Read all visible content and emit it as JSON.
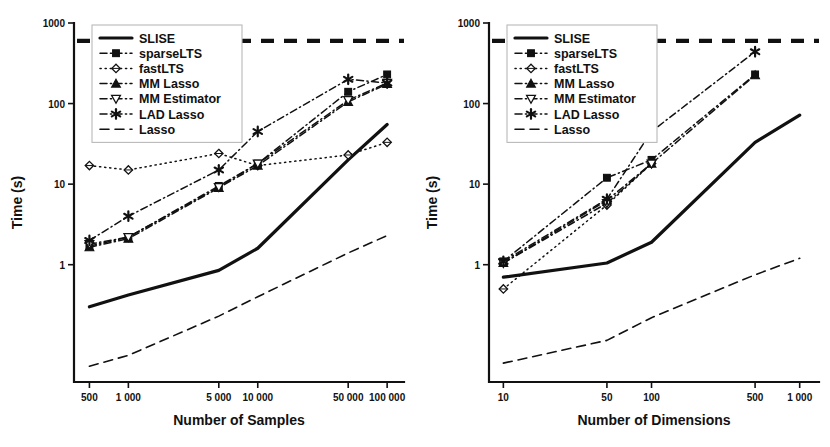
{
  "figure": {
    "background": "#ffffff",
    "ink": "#111111"
  },
  "legend": {
    "entries": [
      {
        "label": "SLISE",
        "key": "slise",
        "dash": "none",
        "width": 3.2,
        "marker": "none"
      },
      {
        "label": "sparseLTS",
        "key": "sparselts",
        "dash": "dashdot",
        "width": 1.5,
        "marker": "square"
      },
      {
        "label": "fastLTS",
        "key": "fastlts",
        "dash": "dotted",
        "width": 1.5,
        "marker": "diamond"
      },
      {
        "label": "MM Lasso",
        "key": "mmlasso",
        "dash": "dashdot",
        "width": 1.5,
        "marker": "triangle-up"
      },
      {
        "label": "MM Estimator",
        "key": "mmestimator",
        "dash": "dashdot",
        "width": 1.5,
        "marker": "triangle-down"
      },
      {
        "label": "LAD Lasso",
        "key": "ladlasso",
        "dash": "dashdot",
        "width": 1.5,
        "marker": "asterisk"
      },
      {
        "label": "Lasso",
        "key": "lasso",
        "dash": "dashed",
        "width": 1.6,
        "marker": "none"
      }
    ]
  },
  "chart_data": [
    {
      "id": "samples",
      "type": "line",
      "title": "",
      "xlabel": "Number of Samples",
      "ylabel": "Time (s)",
      "xscale": "log",
      "yscale": "log",
      "xlim": [
        380,
        135000
      ],
      "ylim": [
        0.035,
        1000
      ],
      "xticks": [
        500,
        1000,
        5000,
        10000,
        50000,
        100000
      ],
      "xticklabels": [
        "500",
        "1 000",
        "5 000",
        "10 000",
        "50 000",
        "100 000"
      ],
      "yticks": [
        1,
        10,
        100,
        1000
      ],
      "yticklabels": [
        "1",
        "10",
        "100",
        "1000"
      ],
      "grid": false,
      "legend_position": "top-left",
      "timeout_line": {
        "value": 600,
        "label": "",
        "dash": "long-dash",
        "width": 4.2
      },
      "series": [
        {
          "name": "SLISE",
          "key": "slise",
          "x": [
            500,
            1000,
            5000,
            10000,
            50000,
            100000
          ],
          "y": [
            0.3,
            0.42,
            0.85,
            1.6,
            20,
            55
          ]
        },
        {
          "name": "sparseLTS",
          "key": "sparselts",
          "x": [
            500,
            1000,
            5000,
            10000,
            50000,
            100000
          ],
          "y": [
            1.7,
            2.2,
            9.5,
            18,
            140,
            230
          ]
        },
        {
          "name": "fastLTS",
          "key": "fastlts",
          "x": [
            500,
            1000,
            5000,
            10000,
            50000,
            100000
          ],
          "y": [
            17,
            15,
            24,
            17,
            23,
            33
          ]
        },
        {
          "name": "MM Lasso",
          "key": "mmlasso",
          "x": [
            500,
            1000,
            5000,
            10000,
            50000,
            100000
          ],
          "y": [
            1.65,
            2.1,
            9.0,
            17,
            105,
            175
          ]
        },
        {
          "name": "MM Estimator",
          "key": "mmestimator",
          "x": [
            500,
            1000,
            5000,
            10000,
            50000,
            100000
          ],
          "y": [
            1.8,
            2.2,
            9.2,
            18,
            110,
            180
          ]
        },
        {
          "name": "LAD Lasso",
          "key": "ladlasso",
          "x": [
            500,
            1000,
            5000,
            10000,
            50000,
            100000
          ],
          "y": [
            2.0,
            4.0,
            15,
            45,
            200,
            180
          ]
        },
        {
          "name": "Lasso",
          "key": "lasso",
          "x": [
            500,
            1000,
            5000,
            10000,
            50000,
            100000
          ],
          "y": [
            0.055,
            0.075,
            0.23,
            0.4,
            1.4,
            2.3
          ]
        }
      ]
    },
    {
      "id": "dimensions",
      "type": "line",
      "title": "",
      "xlabel": "Number of Dimensions",
      "ylabel": "Time (s)",
      "xscale": "log",
      "yscale": "log",
      "xlim": [
        8,
        1350
      ],
      "ylim": [
        0.035,
        1000
      ],
      "xticks": [
        10,
        50,
        100,
        500,
        1000
      ],
      "xticklabels": [
        "10",
        "50",
        "100",
        "500",
        "1 000"
      ],
      "yticks": [
        1,
        10,
        100,
        1000
      ],
      "yticklabels": [
        "1",
        "10",
        "100",
        "1000"
      ],
      "grid": false,
      "legend_position": "top-left",
      "timeout_line": {
        "value": 600,
        "label": "",
        "dash": "long-dash",
        "width": 4.2
      },
      "series": [
        {
          "name": "SLISE",
          "key": "slise",
          "x": [
            10,
            50,
            100,
            500,
            1000
          ],
          "y": [
            0.7,
            1.05,
            1.9,
            33,
            72
          ]
        },
        {
          "name": "sparseLTS",
          "key": "sparselts",
          "x": [
            10,
            50,
            100,
            500
          ],
          "y": [
            1.1,
            12,
            20,
            230
          ]
        },
        {
          "name": "fastLTS",
          "key": "fastlts",
          "x": [
            10,
            50,
            100
          ],
          "y": [
            0.5,
            5.5,
            18
          ]
        },
        {
          "name": "MM Lasso",
          "key": "mmlasso",
          "x": [
            10,
            50,
            100,
            500
          ],
          "y": [
            1.05,
            6.3,
            18,
            225
          ]
        },
        {
          "name": "MM Estimator",
          "key": "mmestimator",
          "x": [
            10,
            50,
            100
          ],
          "y": [
            1.05,
            5.8,
            18
          ]
        },
        {
          "name": "LAD Lasso",
          "key": "ladlasso",
          "x": [
            10,
            50,
            100,
            500
          ],
          "y": [
            1.1,
            6.5,
            45,
            440
          ]
        },
        {
          "name": "Lasso",
          "key": "lasso",
          "x": [
            10,
            50,
            100,
            500,
            1000
          ],
          "y": [
            0.06,
            0.115,
            0.22,
            0.75,
            1.2
          ]
        }
      ]
    }
  ]
}
